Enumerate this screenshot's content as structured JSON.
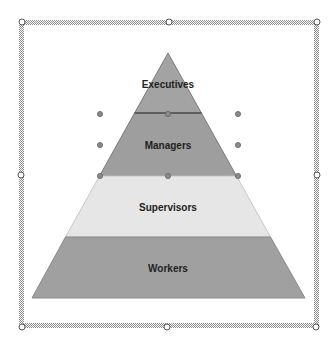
{
  "diagram": {
    "type": "pyramid",
    "levels": [
      {
        "label": "Executives",
        "fill": "#a3a3a3"
      },
      {
        "label": "Managers",
        "fill": "#9e9e9e"
      },
      {
        "label": "Supervisors",
        "fill": "#e6e6e6"
      },
      {
        "label": "Workers",
        "fill": "#a0a0a0"
      }
    ]
  },
  "selection": {
    "frame_color": "#9a9a9a",
    "handle_fill": "#ffffff",
    "inner_handle_fill": "#8a8a8a"
  }
}
